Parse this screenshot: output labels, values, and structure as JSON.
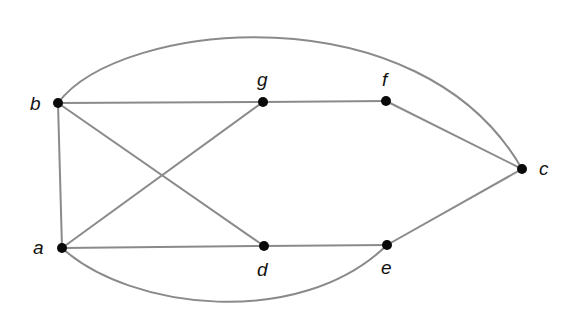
{
  "diagram": {
    "type": "undirected-graph",
    "colors": {
      "edge": "#8a8a8a",
      "node": "#0a0a0a",
      "label": "#111111",
      "background": "#ffffff"
    },
    "nodes": [
      {
        "id": "a",
        "label": "a",
        "x": 62,
        "y": 248
      },
      {
        "id": "b",
        "label": "b",
        "x": 58,
        "y": 103
      },
      {
        "id": "c",
        "label": "c",
        "x": 522,
        "y": 169
      },
      {
        "id": "d",
        "label": "d",
        "x": 264,
        "y": 246
      },
      {
        "id": "e",
        "label": "e",
        "x": 387,
        "y": 245
      },
      {
        "id": "f",
        "label": "f",
        "x": 386,
        "y": 101
      },
      {
        "id": "g",
        "label": "g",
        "x": 263,
        "y": 102
      }
    ],
    "edges": [
      {
        "from": "b",
        "to": "g",
        "shape": "line"
      },
      {
        "from": "g",
        "to": "f",
        "shape": "line"
      },
      {
        "from": "f",
        "to": "c",
        "shape": "line"
      },
      {
        "from": "b",
        "to": "a",
        "shape": "line"
      },
      {
        "from": "b",
        "to": "d",
        "shape": "line"
      },
      {
        "from": "a",
        "to": "g",
        "shape": "line"
      },
      {
        "from": "a",
        "to": "d",
        "shape": "line"
      },
      {
        "from": "d",
        "to": "e",
        "shape": "line"
      },
      {
        "from": "e",
        "to": "c",
        "shape": "line"
      },
      {
        "from": "b",
        "to": "c",
        "shape": "arc-top"
      },
      {
        "from": "a",
        "to": "e",
        "shape": "arc-bottom"
      }
    ]
  }
}
